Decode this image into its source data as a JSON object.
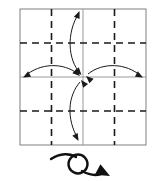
{
  "diagram": {
    "title": "Origami step: collapse corners to center, then turn over",
    "type": "origami-instruction",
    "paper": {
      "shape": "square",
      "x": 20,
      "y": 9,
      "width": 126,
      "height": 136,
      "outline_color": "#8a8a8a",
      "outline_width": 1.1,
      "fill_color": "#ffffff"
    },
    "creases": {
      "solid_color": "#9a9a9a",
      "solid_width": 1.0,
      "dashed_color": "#1a1a1a",
      "dashed_width": 1.6,
      "dash_pattern": "7 5",
      "solid_lines": [
        {
          "name": "center-vertical",
          "x1": 83,
          "y1": 9,
          "x2": 83,
          "y2": 145
        },
        {
          "name": "center-horizontal",
          "x1": 20,
          "y1": 77,
          "x2": 146,
          "y2": 77
        }
      ],
      "dashed_lines": [
        {
          "name": "quarter-vertical-left",
          "x1": 51.5,
          "y1": 9,
          "x2": 51.5,
          "y2": 145
        },
        {
          "name": "quarter-vertical-right",
          "x1": 114.5,
          "y1": 9,
          "x2": 114.5,
          "y2": 145
        },
        {
          "name": "quarter-horizontal-top",
          "x1": 20,
          "y1": 43,
          "x2": 146,
          "y2": 43
        },
        {
          "name": "quarter-horizontal-bottom",
          "x1": 20,
          "y1": 111,
          "x2": 146,
          "y2": 111
        }
      ]
    },
    "fold_arrows": {
      "color": "#1a1a1a",
      "stroke_width": 1.0,
      "items": [
        {
          "name": "fold-arrow-top",
          "label": "top edge to center",
          "path": "M 79,13 C 66,33 68,60 80,73",
          "heads": [
            {
              "at": "top",
              "tip_x": 79.5,
              "tip_y": 11.0,
              "angle": -68
            },
            {
              "at": "center",
              "tip_x": 81.5,
              "tip_y": 75.0,
              "angle": 48
            }
          ]
        },
        {
          "name": "fold-arrow-bottom",
          "label": "bottom edge to center",
          "path": "M 80,82 C 68,96 66,118 78,139",
          "heads": [
            {
              "at": "center",
              "tip_x": 81.0,
              "tip_y": 80.0,
              "angle": -128
            },
            {
              "at": "bottom",
              "tip_x": 78.5,
              "tip_y": 141.0,
              "angle": 62
            }
          ]
        },
        {
          "name": "fold-arrow-left",
          "label": "left edge to center",
          "path": "M 25,76 C 40,63 63,62 78,74",
          "heads": [
            {
              "at": "left",
              "tip_x": 23.0,
              "tip_y": 77.5,
              "angle": 152
            },
            {
              "at": "center",
              "tip_x": 80.0,
              "tip_y": 76.0,
              "angle": 42
            }
          ]
        },
        {
          "name": "fold-arrow-right",
          "label": "right edge to center",
          "path": "M 88,74 C 103,62 126,63 141,76",
          "heads": [
            {
              "at": "center",
              "tip_x": 86.0,
              "tip_y": 76.0,
              "angle": -138
            },
            {
              "at": "right",
              "tip_x": 143.0,
              "tip_y": 77.5,
              "angle": 28
            }
          ]
        }
      ]
    },
    "turn_over_symbol": {
      "name": "turn-over-symbol",
      "label": "turn the model over",
      "color": "#111111",
      "stroke_width": 2.4,
      "loop": {
        "cx": 78,
        "cy": 164,
        "r": 9.5
      },
      "tail_path": "M 51,159 C 60,153 70,153 76,157",
      "exit_path": "M 82,171 C 89,175 95,176 101,174",
      "head": {
        "tip_x": 110,
        "tip_y": 176,
        "angle": 28
      }
    }
  }
}
